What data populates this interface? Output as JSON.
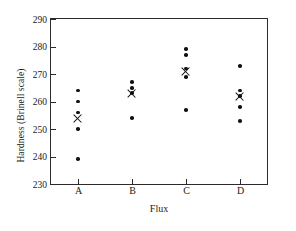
{
  "chart_data": {
    "type": "scatter",
    "title": "",
    "xlabel": "Flux",
    "ylabel": "Hardness (Brinell scale)",
    "categories": [
      "A",
      "B",
      "C",
      "D"
    ],
    "ylim": [
      230,
      290
    ],
    "yticks": [
      230,
      240,
      250,
      260,
      270,
      280,
      290
    ],
    "ytick_labels": [
      "230",
      "240",
      "250",
      "260",
      "270",
      "280",
      "290"
    ],
    "grid": false,
    "legend": false,
    "marker_style": {
      "point": "filled-circle",
      "mean": "x-cross"
    },
    "groups": [
      {
        "name": "A",
        "values": [
          264,
          260,
          256,
          250,
          239
        ],
        "mean": 253.8
      },
      {
        "name": "B",
        "values": [
          267,
          265,
          263,
          254
        ],
        "mean": 263.0
      },
      {
        "name": "C",
        "values": [
          279,
          277,
          272,
          269,
          257
        ],
        "mean": 271.0
      },
      {
        "name": "D",
        "values": [
          273,
          264,
          262,
          258,
          253
        ],
        "mean": 262.0
      }
    ]
  },
  "axis": {
    "y_title": "Hardness (Brinell scale)",
    "x_title": "Flux"
  },
  "colors": {
    "marker": "#111111",
    "frame": "#2b2b2b",
    "background": "#ffffff"
  }
}
